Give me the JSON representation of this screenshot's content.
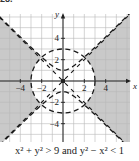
{
  "exercise": {
    "label": "28."
  },
  "caption": "x² + y² > 9  and  y² − x² < 1",
  "colors": {
    "shade": "#c9c9c9",
    "grid": "#b8b8b8",
    "axis": "#222222",
    "curve": "#1a1a1a",
    "background": "#ffffff"
  },
  "chart_data": {
    "type": "region",
    "title": "x² + y² > 9 and y² − x² < 1",
    "xlabel": "x",
    "ylabel": "y",
    "xlim": [
      -6,
      6.2
    ],
    "ylim": [
      -5.8,
      6.3
    ],
    "grid": true,
    "grid_step": 1,
    "x_ticks": [
      -4,
      -2,
      2,
      4
    ],
    "y_ticks": [
      4,
      2,
      -2,
      -4
    ],
    "x_tick_labels": [
      "−4",
      "−2",
      "2",
      "4"
    ],
    "y_tick_labels": [
      "4",
      "2",
      "−2",
      "−4"
    ],
    "boundaries": [
      {
        "name": "circle",
        "equation": "x² + y² = 9",
        "radius": 3,
        "style": "dashed"
      },
      {
        "name": "hyperbola",
        "equation": "y² − x² = 1",
        "vertices": [
          [
            0,
            1
          ],
          [
            0,
            -1
          ]
        ],
        "asymptotes": [
          "y = x",
          "y = −x"
        ],
        "style": "dashed"
      }
    ],
    "shaded_region": "outside circle radius 3 and between hyperbola branches (left and right regions)",
    "annotations": []
  }
}
